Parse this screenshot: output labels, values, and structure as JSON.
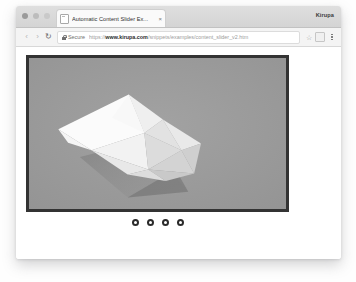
{
  "window": {
    "user_label": "Kirupa",
    "traffic_lights": [
      "close-dot",
      "minimize-dot",
      "maximize-dot"
    ]
  },
  "tab": {
    "favicon": "page-icon",
    "title": "Automatic Content Slider Ex...",
    "close_label": "×"
  },
  "toolbar": {
    "back_label": "‹",
    "forward_label": "›",
    "reload_label": "↻",
    "security_icon": "lock-icon",
    "security_label": "Secure",
    "url": {
      "scheme": "https://",
      "host": "www.kirupa.com",
      "path": "/snippets/examples/content_slider_v2.htm"
    },
    "bookmark_label": "☆",
    "profile_icon": "profile-icon",
    "menu_icon": "kebab-menu-icon"
  },
  "slider": {
    "border_color": "#333333",
    "background_color": "#9b9b9b",
    "current_slide": 1,
    "slide_artwork": "white-faceted-polyhedron",
    "pager_dots": [
      {
        "index": 1,
        "active": true
      },
      {
        "index": 2,
        "active": false
      },
      {
        "index": 3,
        "active": false
      },
      {
        "index": 4,
        "active": false
      }
    ]
  },
  "colors": {
    "slide_bg": "#9b9b9b",
    "slide_border": "#333333",
    "dot_ring": "#2b2b2b",
    "dot_fill": "#ffffff",
    "page_bg": "#ffffff"
  }
}
